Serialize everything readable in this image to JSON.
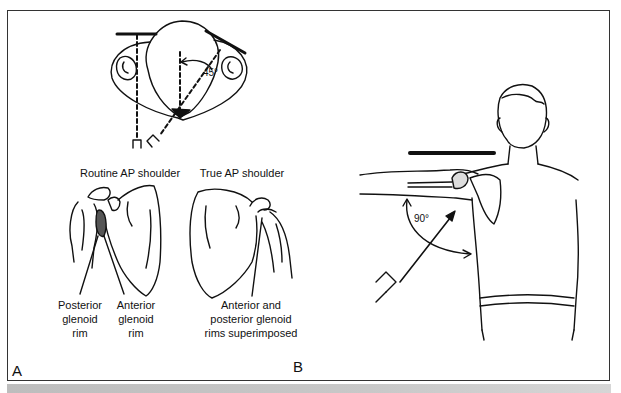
{
  "figure": {
    "panels": [
      {
        "letter": "A",
        "top_view": {
          "angle_label": "45°"
        },
        "left_view": {
          "title": "Routine AP shoulder",
          "labels": [
            {
              "lines": [
                "Posterior",
                "glenoid",
                "rim"
              ]
            },
            {
              "lines": [
                "Anterior",
                "glenoid",
                "rim"
              ]
            }
          ]
        },
        "right_view": {
          "title": "True AP shoulder",
          "labels": [
            {
              "lines": [
                "Anterior and",
                "posterior glenoid",
                "rims superimposed"
              ]
            }
          ]
        }
      },
      {
        "letter": "B",
        "angle_label": "90°"
      }
    ],
    "colors": {
      "ink": "#111111",
      "frame": "#333333",
      "band": "#c4c4c4",
      "shade": "#555555"
    }
  }
}
